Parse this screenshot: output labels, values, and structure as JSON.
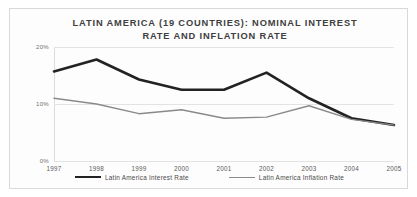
{
  "chart_data": {
    "type": "line",
    "title": "LATIN AMERICA (19 COUNTRIES): NOMINAL INTEREST RATE AND INFLATION RATE",
    "title_line1": "LATIN AMERICA (19 COUNTRIES): NOMINAL INTEREST",
    "title_line2": "RATE AND INFLATION RATE",
    "xlabel": "",
    "ylabel": "",
    "categories": [
      "1997",
      "1998",
      "1999",
      "2000",
      "2001",
      "2002",
      "2003",
      "2004",
      "2005"
    ],
    "ylim": [
      0,
      20
    ],
    "yticks": [
      0,
      10,
      20
    ],
    "ytick_labels": [
      "0%",
      "10%",
      "20%"
    ],
    "grid": true,
    "legend_position": "bottom",
    "series": [
      {
        "name": "Latin America Interest Rate",
        "color": "#222222",
        "width": 2.6,
        "values": [
          15.7,
          17.8,
          14.3,
          12.5,
          12.5,
          15.5,
          11.0,
          7.5,
          6.3
        ]
      },
      {
        "name": "Latin America Inflation Rate",
        "color": "#8a8a8a",
        "width": 1.4,
        "values": [
          11.0,
          10.0,
          8.3,
          9.0,
          7.5,
          7.7,
          9.7,
          7.3,
          6.3
        ]
      }
    ]
  }
}
